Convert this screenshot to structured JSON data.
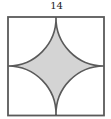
{
  "diagram": {
    "type": "geometry",
    "shape": "square with four quarter-circle arcs centered at corners",
    "side_label": "14",
    "shaded_region": "concave four-pointed region between arcs",
    "colors": {
      "stroke": "#555555",
      "fill": "#d4d4d4",
      "background": "#ffffff"
    }
  }
}
